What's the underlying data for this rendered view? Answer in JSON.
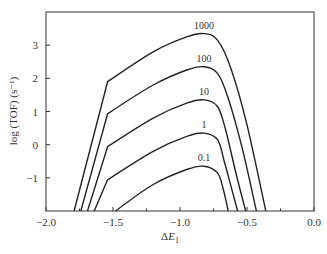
{
  "chart_data": {
    "type": "line",
    "title": "",
    "xlabel": "ΔE₁",
    "xlabel_main": "ΔE",
    "xlabel_sub": "1",
    "ylabel": "log (TOF) (s⁻¹)",
    "xlim": [
      -2.0,
      0.0
    ],
    "ylim": [
      -2.0,
      4.0
    ],
    "grid": false,
    "legend": "inline labels above each curve peak",
    "x_ticks": [
      -2.0,
      -1.5,
      -1.0,
      -0.5,
      0.0
    ],
    "x_tick_labels": [
      "−2.0",
      "−1.5",
      "−1.0",
      "−0.5",
      "0.0"
    ],
    "x_minor_ticks": [
      -1.75,
      -1.25,
      -0.75,
      -0.25
    ],
    "y_ticks": [
      -1,
      0,
      1,
      2,
      3
    ],
    "y_tick_labels": [
      "−1",
      "0",
      "1",
      "2",
      "3"
    ],
    "series": [
      {
        "name": "1000",
        "label": "1000",
        "points": [
          [
            -1.79,
            -2.0
          ],
          [
            -1.54,
            1.9
          ],
          [
            -1.2,
            2.8
          ],
          [
            -0.95,
            3.25
          ],
          [
            -0.82,
            3.35
          ],
          [
            -0.72,
            3.15
          ],
          [
            -0.62,
            2.3
          ],
          [
            -0.5,
            0.6
          ],
          [
            -0.36,
            -2.0
          ]
        ]
      },
      {
        "name": "100",
        "label": "100",
        "points": [
          [
            -1.74,
            -2.0
          ],
          [
            -1.54,
            0.93
          ],
          [
            -1.2,
            1.8
          ],
          [
            -0.95,
            2.25
          ],
          [
            -0.82,
            2.35
          ],
          [
            -0.72,
            2.15
          ],
          [
            -0.64,
            1.4
          ],
          [
            -0.53,
            -0.2
          ],
          [
            -0.43,
            -2.0
          ]
        ]
      },
      {
        "name": "10",
        "label": "10",
        "points": [
          [
            -1.69,
            -2.0
          ],
          [
            -1.54,
            -0.06
          ],
          [
            -1.2,
            0.8
          ],
          [
            -0.95,
            1.25
          ],
          [
            -0.82,
            1.35
          ],
          [
            -0.72,
            1.15
          ],
          [
            -0.66,
            0.45
          ],
          [
            -0.58,
            -0.9
          ],
          [
            -0.51,
            -2.0
          ]
        ]
      },
      {
        "name": "1",
        "label": "1",
        "points": [
          [
            -1.64,
            -2.0
          ],
          [
            -1.54,
            -1.06
          ],
          [
            -1.2,
            -0.2
          ],
          [
            -0.95,
            0.25
          ],
          [
            -0.82,
            0.35
          ],
          [
            -0.72,
            0.15
          ],
          [
            -0.67,
            -0.5
          ],
          [
            -0.61,
            -1.4
          ],
          [
            -0.57,
            -2.0
          ]
        ]
      },
      {
        "name": "0.1",
        "label": "0.1",
        "points": [
          [
            -1.48,
            -2.0
          ],
          [
            -1.2,
            -1.2
          ],
          [
            -0.95,
            -0.75
          ],
          [
            -0.82,
            -0.65
          ],
          [
            -0.72,
            -0.85
          ],
          [
            -0.68,
            -1.3
          ],
          [
            -0.64,
            -2.0
          ]
        ]
      }
    ]
  },
  "layout": {
    "plot": {
      "left": 46,
      "top": 12,
      "right": 314,
      "bottom": 211
    },
    "line_color": "#222222",
    "axis_color": "#333333"
  }
}
